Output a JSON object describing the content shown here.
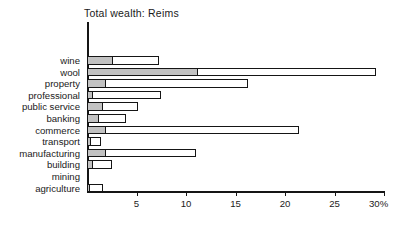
{
  "chart_data": {
    "type": "bar",
    "orientation": "horizontal",
    "stacked": true,
    "title": "Total wealth: Reims",
    "xlabel": "",
    "ylabel": "",
    "xlim": [
      0,
      30
    ],
    "grid": false,
    "legend": "none",
    "unit": "%",
    "categories": [
      "wine",
      "wool",
      "property",
      "professional",
      "public service",
      "banking",
      "commerce",
      "transport",
      "manufacturing",
      "building",
      "mining",
      "agriculture"
    ],
    "series": [
      {
        "name": "inner-shaded",
        "values": [
          2.6,
          11.2,
          1.9,
          0.6,
          1.6,
          1.2,
          1.9,
          0.4,
          1.9,
          0.6,
          0.0,
          0.3
        ]
      },
      {
        "name": "outer-open",
        "values": [
          7.3,
          29.2,
          16.3,
          7.5,
          5.2,
          3.9,
          21.4,
          1.4,
          11.0,
          2.5,
          0.0,
          1.6
        ]
      }
    ],
    "xticks": [
      5,
      10,
      15,
      20,
      25,
      30
    ],
    "xtick_labels": [
      "5",
      "10",
      "15",
      "20",
      "25",
      "30%"
    ],
    "colors": {
      "inner_fill": "#c2c2c2",
      "outer_fill": "#ffffff",
      "stroke": "#151515",
      "text": "#1a1a1a"
    }
  }
}
